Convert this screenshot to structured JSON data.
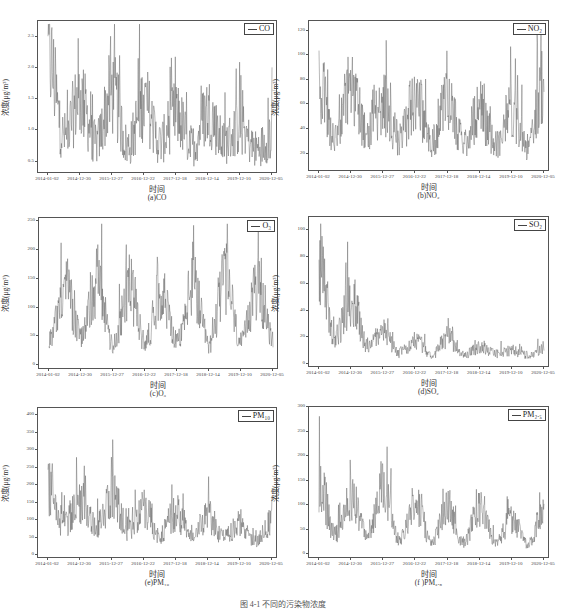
{
  "figure_caption": "图 4-1  不同的污染物浓度",
  "x_axis_title": "时间",
  "y_axis_title": "浓度(μg/m³)",
  "x_ticks": [
    "2014-01-02",
    "2014-12-30",
    "2015-12-27",
    "2016-12-22",
    "2017-12-18",
    "2018-12-14",
    "2019-12-10",
    "2020-12-05"
  ],
  "panels": [
    {
      "id": "a",
      "caption": "(a)CO",
      "legend": "CO",
      "yticks": [
        "0.5",
        "1.0",
        "1.5",
        "2.0",
        "2.5"
      ]
    },
    {
      "id": "b",
      "caption": "(b)NO₂",
      "legend": "NO₂",
      "yticks": [
        "20",
        "40",
        "60",
        "80",
        "100",
        "120"
      ]
    },
    {
      "id": "c",
      "caption": "(c)O₃",
      "legend": "O₃",
      "yticks": [
        "0",
        "50",
        "100",
        "150",
        "200",
        "250"
      ]
    },
    {
      "id": "d",
      "caption": "(d)SO₂",
      "legend": "SO₂",
      "yticks": [
        "0",
        "20",
        "40",
        "60",
        "80",
        "100"
      ]
    },
    {
      "id": "e",
      "caption": "(e)PM₁₀",
      "legend": "PM₁₀",
      "yticks": [
        "0",
        "50",
        "100",
        "150",
        "200",
        "250",
        "300",
        "350",
        "400"
      ]
    },
    {
      "id": "f",
      "caption": "(f )PM₂.₅",
      "legend": "PM₂.₅",
      "yticks": [
        "0",
        "50",
        "100",
        "150",
        "200",
        "250",
        "300"
      ]
    }
  ],
  "chart_data": [
    {
      "type": "line",
      "title": "(a)CO",
      "xlabel": "时间",
      "ylabel": "浓度(μg/m³)",
      "legend": [
        "CO"
      ],
      "ylim": [
        0.3,
        2.75
      ],
      "grid": false,
      "legend_position": "upper right",
      "x": [
        "2014-01-02",
        "2014-07",
        "2014-12-30",
        "2015-07",
        "2015-12-27",
        "2016-07",
        "2016-12-22",
        "2017-07",
        "2017-12-18",
        "2018-07",
        "2018-12-14",
        "2019-07",
        "2019-12-10",
        "2020-07",
        "2020-12-05"
      ],
      "series": [
        {
          "name": "CO",
          "values": [
            2.2,
            0.9,
            1.5,
            0.8,
            1.6,
            0.75,
            1.45,
            0.8,
            1.25,
            0.75,
            1.3,
            0.8,
            1.05,
            0.7,
            0.9
          ]
        }
      ],
      "peaks": {
        "max": 2.7,
        "min": 0.4
      }
    },
    {
      "type": "line",
      "title": "(b)NO₂",
      "xlabel": "时间",
      "ylabel": "浓度(μg/m³)",
      "legend": [
        "NO₂"
      ],
      "ylim": [
        5,
        128
      ],
      "grid": false,
      "legend_position": "upper right",
      "x": [
        "2014-01-02",
        "2014-07",
        "2014-12-30",
        "2015-07",
        "2015-12-27",
        "2016-07",
        "2016-12-22",
        "2017-07",
        "2017-12-18",
        "2018-07",
        "2018-12-14",
        "2019-07",
        "2019-12-10",
        "2020-07",
        "2020-12-05"
      ],
      "series": [
        {
          "name": "NO₂",
          "values": [
            75,
            35,
            72,
            35,
            60,
            32,
            65,
            30,
            60,
            30,
            55,
            28,
            55,
            25,
            80
          ]
        }
      ],
      "peaks": {
        "max": 118,
        "min": 12
      }
    },
    {
      "type": "line",
      "title": "(c)O₃",
      "xlabel": "时间",
      "ylabel": "浓度(μg/m³)",
      "legend": [
        "O₃"
      ],
      "ylim": [
        -8,
        255
      ],
      "grid": false,
      "legend_position": "upper right",
      "x": [
        "2014-01-02",
        "2014-07",
        "2014-12-30",
        "2015-07",
        "2015-12-27",
        "2016-07",
        "2016-12-22",
        "2017-07",
        "2017-12-18",
        "2018-07",
        "2018-12-14",
        "2019-07",
        "2019-12-10",
        "2020-07",
        "2020-12-05"
      ],
      "series": [
        {
          "name": "O₃",
          "values": [
            45,
            140,
            50,
            145,
            35,
            140,
            40,
            130,
            40,
            135,
            35,
            150,
            40,
            135,
            45
          ]
        }
      ],
      "peaks": {
        "max": 245,
        "min": 2
      }
    },
    {
      "type": "line",
      "title": "(d)SO₂",
      "xlabel": "时间",
      "ylabel": "浓度(μg/m³)",
      "legend": [
        "SO₂"
      ],
      "ylim": [
        -3,
        110
      ],
      "grid": false,
      "legend_position": "upper right",
      "x": [
        "2014-01-02",
        "2014-07",
        "2014-12-30",
        "2015-07",
        "2015-12-27",
        "2016-07",
        "2016-12-22",
        "2017-07",
        "2017-12-18",
        "2018-07",
        "2018-12-14",
        "2019-07",
        "2019-12-10",
        "2020-07",
        "2020-12-05"
      ],
      "series": [
        {
          "name": "SO₂",
          "values": [
            80,
            20,
            50,
            14,
            25,
            8,
            18,
            6,
            20,
            7,
            12,
            8,
            10,
            7,
            12
          ]
        }
      ],
      "peaks": {
        "max": 105,
        "min": 4
      }
    },
    {
      "type": "line",
      "title": "(e)PM₁₀",
      "xlabel": "时间",
      "ylabel": "浓度(μg/m³)",
      "legend": [
        "PM₁₀"
      ],
      "ylim": [
        -10,
        420
      ],
      "grid": false,
      "legend_position": "upper right",
      "x": [
        "2014-01-02",
        "2014-07",
        "2014-12-30",
        "2015-07",
        "2015-12-27",
        "2016-07",
        "2016-12-22",
        "2017-07",
        "2017-12-18",
        "2018-07",
        "2018-12-14",
        "2019-07",
        "2019-12-10",
        "2020-07",
        "2020-12-05"
      ],
      "series": [
        {
          "name": "PM₁₀",
          "values": [
            200,
            90,
            150,
            80,
            170,
            75,
            130,
            60,
            120,
            55,
            110,
            50,
            95,
            40,
            100
          ]
        }
      ],
      "peaks": {
        "max": 405,
        "min": 5
      }
    },
    {
      "type": "line",
      "title": "(f)PM₂.₅",
      "xlabel": "时间",
      "ylabel": "浓度(μg/m³)",
      "legend": [
        "PM₂.₅"
      ],
      "ylim": [
        -10,
        300
      ],
      "grid": false,
      "legend_position": "upper right",
      "x": [
        "2014-01-02",
        "2014-07",
        "2014-12-30",
        "2015-07",
        "2015-12-27",
        "2016-07",
        "2016-12-22",
        "2017-07",
        "2017-12-18",
        "2018-07",
        "2018-12-14",
        "2019-07",
        "2019-12-10",
        "2020-07",
        "2020-12-05"
      ],
      "series": [
        {
          "name": "PM₂.₅",
          "values": [
            150,
            40,
            120,
            35,
            140,
            30,
            100,
            25,
            95,
            22,
            100,
            25,
            70,
            20,
            90
          ]
        }
      ],
      "peaks": {
        "max": 285,
        "min": 2
      }
    }
  ]
}
